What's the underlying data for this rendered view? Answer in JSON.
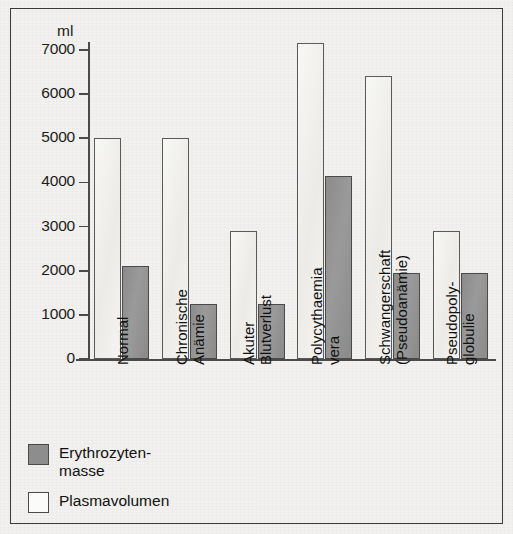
{
  "chart_data": {
    "type": "bar",
    "title": "",
    "xlabel": "",
    "ylabel": "ml",
    "ylim": [
      0,
      7000
    ],
    "yticks": [
      0,
      1000,
      2000,
      3000,
      4000,
      5000,
      6000,
      7000
    ],
    "ytick_labels": [
      "0",
      "1000",
      "2000",
      "3000",
      "4000",
      "5000",
      "6000",
      "7000"
    ],
    "grid": false,
    "legend_position": "bottom-left",
    "categories": [
      "Normal",
      "Chronische Anämie",
      "Akuter Blutverlust",
      "Polycythaemia vera",
      "Schwangerschaft (Pseudoanämie)",
      "Pseudopoly-globulie"
    ],
    "category_lines": [
      [
        "Normal"
      ],
      [
        "Chronische",
        "Anämie"
      ],
      [
        "Akuter",
        "Blutverlust"
      ],
      [
        "Polycythaemia",
        "vera"
      ],
      [
        "Schwangerschaft",
        "(Pseudoanämie)"
      ],
      [
        "Pseudopoly-",
        "globulie"
      ]
    ],
    "series": [
      {
        "name": "Plasmavolumen",
        "color": "#f2f1ee",
        "values": [
          5000,
          5000,
          2900,
          7150,
          6400,
          2900
        ]
      },
      {
        "name": "Erythrozytenmasse",
        "color": "#8d8d8d",
        "values": [
          2100,
          1250,
          1250,
          4150,
          1950,
          1950
        ]
      }
    ]
  },
  "axis": {
    "unit_label": "ml"
  },
  "legend": {
    "items": [
      {
        "label_line1": "Erythrozyten-",
        "label_line2": "masse",
        "swatch": "dark-gray"
      },
      {
        "label_line1": "Plasmavolumen",
        "label_line2": "",
        "swatch": "white"
      }
    ]
  }
}
